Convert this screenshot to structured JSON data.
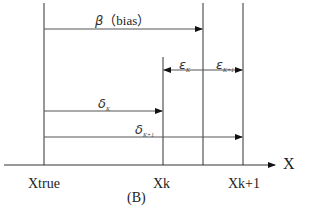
{
  "diagram": {
    "caption": "(B)",
    "axis": {
      "label": "X",
      "ticks": [
        {
          "id": "xtrue",
          "label": "Xtrue"
        },
        {
          "id": "xk",
          "label": "Xk"
        },
        {
          "id": "xk1",
          "label": "Xk+1"
        }
      ]
    },
    "arrows": {
      "bias": {
        "symbol": "β",
        "text": "（bias）"
      },
      "epsilon_k": {
        "symbol": "ε",
        "sub": "K"
      },
      "epsilon_k1": {
        "symbol": "ε",
        "sub": "K+1"
      },
      "delta_k": {
        "symbol": "δ",
        "sub": "K"
      },
      "delta_k1": {
        "symbol": "δ",
        "sub": "K+1"
      }
    },
    "colors": {
      "line": "#333333",
      "background": "#ffffff"
    }
  }
}
